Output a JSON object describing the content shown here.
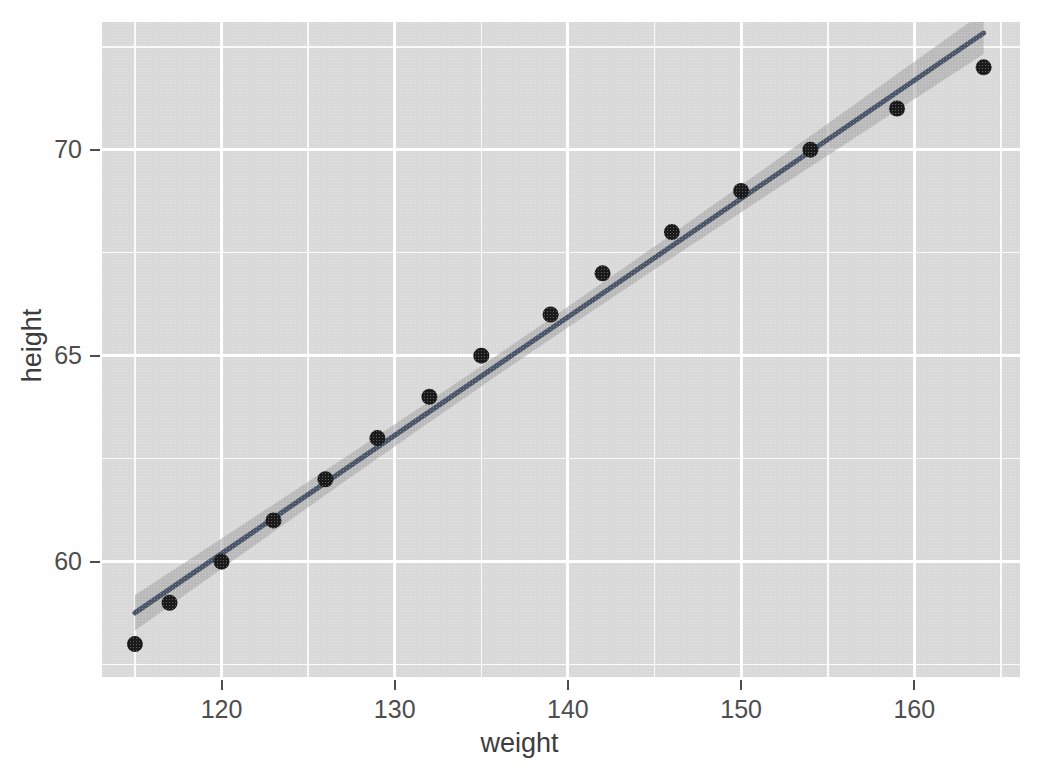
{
  "chart_data": {
    "type": "scatter",
    "title": "",
    "subtitle": "",
    "xlabel": "weight",
    "ylabel": "height",
    "x": [
      115,
      117,
      120,
      123,
      126,
      129,
      132,
      135,
      139,
      142,
      146,
      150,
      154,
      159,
      164
    ],
    "y": [
      58,
      59,
      60,
      61,
      62,
      63,
      64,
      65,
      66,
      67,
      68,
      69,
      70,
      71,
      72
    ],
    "points": [
      {
        "weight": 115,
        "height": 58
      },
      {
        "weight": 117,
        "height": 59
      },
      {
        "weight": 120,
        "height": 60
      },
      {
        "weight": 123,
        "height": 61
      },
      {
        "weight": 126,
        "height": 62
      },
      {
        "weight": 129,
        "height": 63
      },
      {
        "weight": 132,
        "height": 64
      },
      {
        "weight": 135,
        "height": 65
      },
      {
        "weight": 139,
        "height": 66
      },
      {
        "weight": 142,
        "height": 67
      },
      {
        "weight": 146,
        "height": 68
      },
      {
        "weight": 150,
        "height": 69
      },
      {
        "weight": 154,
        "height": 70
      },
      {
        "weight": 159,
        "height": 71
      },
      {
        "weight": 164,
        "height": 72
      }
    ],
    "series": [
      {
        "name": "observations",
        "kind": "points",
        "marker": "filled-circle",
        "color": "#1a1a1a",
        "values": [
          58,
          59,
          60,
          61,
          62,
          63,
          64,
          65,
          66,
          67,
          68,
          69,
          70,
          71,
          72
        ]
      },
      {
        "name": "linear-fit",
        "kind": "line",
        "color": "#4a5568",
        "method": "lm",
        "endpoints": [
          {
            "weight": 115,
            "height": 58.53
          },
          {
            "weight": 164,
            "height": 72.67
          }
        ]
      },
      {
        "name": "confidence-band",
        "kind": "ribbon",
        "color": "#a0a0a0",
        "level": 0.95
      }
    ],
    "xlim": [
      113.1,
      166.1
    ],
    "ylim": [
      57.2,
      73.1
    ],
    "xticks": [
      120,
      130,
      140,
      150,
      160
    ],
    "xtick_labels": [
      "120",
      "130",
      "140",
      "150",
      "160"
    ],
    "yticks": [
      60,
      65,
      70
    ],
    "ytick_labels": [
      "60",
      "65",
      "70"
    ],
    "x_minor_ticks": [
      115,
      125,
      135,
      145,
      155,
      165
    ],
    "y_minor_ticks": [
      57.5,
      62.5,
      67.5,
      72.5
    ],
    "grid": true,
    "legend": "none",
    "panel_background": "#d9d9d9",
    "grid_color": "#ffffff",
    "figure_background": "#ffffff",
    "point_color": "#1a1a1a",
    "line_color": "#4a5568",
    "band_color": "#a0a0a0"
  },
  "axes": {
    "x_title": "weight",
    "y_title": "height",
    "x_tick_labels": [
      "120",
      "130",
      "140",
      "150",
      "160"
    ],
    "y_tick_labels": [
      "70",
      "65",
      "60"
    ]
  }
}
